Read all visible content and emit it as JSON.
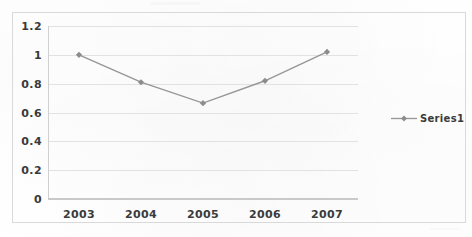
{
  "chart_data": {
    "type": "line",
    "title": "",
    "subtitle": "",
    "xlabel": "",
    "ylabel": "",
    "categories": [
      "2003",
      "2004",
      "2005",
      "2006",
      "2007"
    ],
    "series": [
      {
        "name": "Series1",
        "values": [
          1.0,
          0.81,
          0.665,
          0.82,
          1.02
        ],
        "color": "#969696",
        "marker": "diamond"
      }
    ],
    "ylim": [
      0,
      1.2
    ],
    "ytick_labels": [
      "0",
      "0.2",
      "0.4",
      "0.6",
      "0.8",
      "1",
      "1.2"
    ],
    "ytick_values": [
      0,
      0.2,
      0.4,
      0.6,
      0.8,
      1,
      1.2
    ],
    "grid": "horizontal",
    "legend_position": "right",
    "legend_entries": [
      "Series1"
    ]
  },
  "colors": {
    "series_line": "#969696",
    "marker": "#8c8c8c",
    "gridline": "#e2e2e2",
    "axis": "#c9c9c9",
    "frame_border": "#d9d9d9",
    "tick_text": "#3a3a3a",
    "background": "#ffffff"
  }
}
